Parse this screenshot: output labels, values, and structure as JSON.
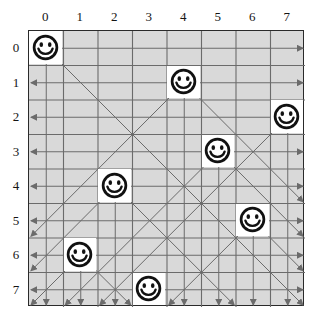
{
  "board": {
    "size": 8,
    "col_labels": [
      "0",
      "1",
      "2",
      "3",
      "4",
      "5",
      "6",
      "7"
    ],
    "row_labels": [
      "0",
      "1",
      "2",
      "3",
      "4",
      "5",
      "6",
      "7"
    ],
    "cell_color": "#d9d9d9",
    "queen_cell_color": "#ffffff",
    "border_color": "#2a2a2a",
    "grid_line_color": "#6b6b6b",
    "arrow_color": "#6b6b6b",
    "geometry": {
      "left": 28,
      "top": 30,
      "cell": 34.5,
      "right": 304,
      "bottom": 306
    }
  },
  "queens": [
    {
      "row": 0,
      "col": 0,
      "icon": "smiley-face-icon"
    },
    {
      "row": 1,
      "col": 4,
      "icon": "smiley-face-icon"
    },
    {
      "row": 2,
      "col": 7,
      "icon": "smiley-face-icon"
    },
    {
      "row": 3,
      "col": 5,
      "icon": "smiley-face-icon"
    },
    {
      "row": 4,
      "col": 2,
      "icon": "smiley-face-icon"
    },
    {
      "row": 5,
      "col": 6,
      "icon": "smiley-face-icon"
    },
    {
      "row": 6,
      "col": 1,
      "icon": "smiley-face-icon"
    },
    {
      "row": 7,
      "col": 3,
      "icon": "smiley-face-icon"
    }
  ],
  "attack_lines": {
    "horizontal_direction": "left-and-right",
    "vertical_direction": "down",
    "diagonal_direction": "down-left-and-down-right",
    "description": "Each queen projects arrows along its row, column and both diagonals"
  }
}
